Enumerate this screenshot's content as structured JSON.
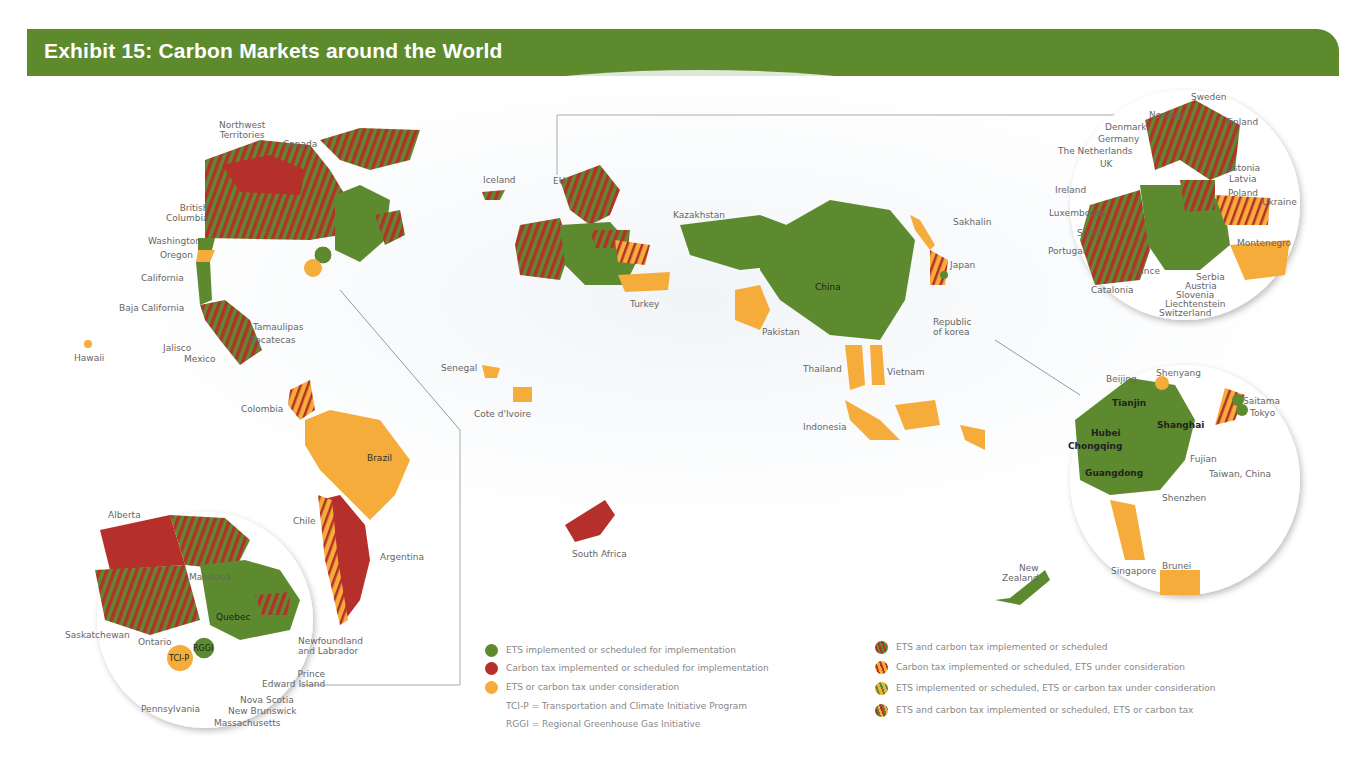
{
  "title": "Exhibit 15: Carbon Markets around the World",
  "colors": {
    "banner": "#5e8a2e",
    "ets": "#5d8a2f",
    "carbon_tax": "#b5302a",
    "under_consideration": "#f5ac3a",
    "ocean_shadow": "#eef2f6"
  },
  "legend": {
    "left": [
      {
        "icon": "green-dot",
        "label": "ETS implemented or scheduled for implementation"
      },
      {
        "icon": "red-dot",
        "label": "Carbon tax implemented or scheduled for implementation"
      },
      {
        "icon": "orange-dot",
        "label": "ETS or carbon tax under consideration"
      },
      {
        "icon": "none",
        "label": "TCI-P = Transportation and Climate Initiative Program"
      },
      {
        "icon": "none",
        "label": "RGGI = Regional Greenhouse Gas Initiative"
      }
    ],
    "right": [
      {
        "icon": "green-red-striped-dot",
        "label": "ETS and carbon tax implemented or scheduled"
      },
      {
        "icon": "red-orange-striped-dot",
        "label": "Carbon tax implemented or scheduled, ETS under consideration"
      },
      {
        "icon": "green-orange-striped-dot",
        "label": "ETS implemented or scheduled, ETS or carbon tax under consideration"
      },
      {
        "icon": "tri-striped-dot",
        "label": "ETS and carbon tax implemented or scheduled, ETS or carbon tax"
      }
    ]
  },
  "labels": {
    "north_america": {
      "northwest_territories": "Northwest\nTerritories",
      "canada": "Canada",
      "british_columbia": "British\nColumbia",
      "washington": "Washington",
      "oregon": "Oregon",
      "california": "California",
      "baja_california": "Baja California",
      "tamaulipas": "Tamaulipas",
      "zacatecas": "Zacatecas",
      "jalisco": "Jalisco",
      "mexico": "Mexico",
      "hawaii": "Hawaii"
    },
    "south_america": {
      "colombia": "Colombia",
      "brazil": "Brazil",
      "chile": "Chile",
      "argentina": "Argentina"
    },
    "canada_inset": {
      "alberta": "Alberta",
      "manitoba": "Manitoba",
      "quebec": "Quebec",
      "saskatchewan": "Saskatchewan",
      "ontario": "Ontario",
      "rggi": "RGGI",
      "tcip": "TCI-P",
      "newfoundland": "Newfoundland\nand Labrador",
      "prince_edward": "Prince\nEdward Island",
      "nova_scotia": "Nova Scotia",
      "new_brunswick": "New Brunswick",
      "massachusetts": "Massachusetts",
      "pennsylvania": "Pennsylvania"
    },
    "world": {
      "iceland": "Iceland",
      "eu": "EU",
      "turkey": "Turkey",
      "kazakhstan": "Kazakhstan",
      "china": "China",
      "sakhalin": "Sakhalin",
      "japan": "Japan",
      "republic_of_korea": "Republic\nof korea",
      "pakistan": "Pakistan",
      "thailand": "Thailand",
      "vietnam": "Vietnam",
      "indonesia": "Indonesia",
      "senegal": "Senegal",
      "cote_divoire": "Cote d'Ivoire",
      "south_africa": "South Africa",
      "new_zealand": "New\nZealand"
    },
    "europe_inset": {
      "sweden": "Sweden",
      "norway": "Norway",
      "finland": "Finland",
      "denmark": "Denmark",
      "germany": "Germany",
      "netherlands": "The Netherlands",
      "uk": "UK",
      "ireland": "Ireland",
      "estonia": "Estonia",
      "latvia": "Latvia",
      "poland": "Poland",
      "ukraine": "Ukraine",
      "luxembourg": "Luxembourg",
      "spain": "Spain",
      "portugal": "Portugal",
      "montenegro": "Montenegro",
      "france": "France",
      "serbia": "Serbia",
      "austria": "Austria",
      "slovenia": "Slovenia",
      "catalonia": "Catalonia",
      "liechtenstein": "Liechtenstein",
      "switzerland": "Switzerland"
    },
    "asia_inset": {
      "beijing": "Beijing",
      "shenyang": "Shenyang",
      "tianjin": "Tianjin",
      "saitama": "Saitama",
      "tokyo": "Tokyo",
      "hubei": "Hubei",
      "shanghai": "Shanghai",
      "chongqing": "Chongqing",
      "fujian": "Fujian",
      "guangdong": "Guangdong",
      "taiwan": "Taiwan, China",
      "shenzhen": "Shenzhen",
      "singapore": "Singapore",
      "brunei": "Brunei"
    }
  }
}
